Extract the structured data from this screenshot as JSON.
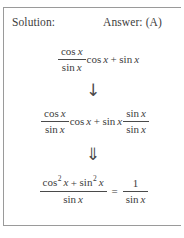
{
  "panel": {
    "header": {
      "solution_label": "Solution:",
      "answer_label": "Answer: (A)"
    },
    "steps": [
      {
        "id": "step-1",
        "description": "cos x over sin x times cos x plus sin x",
        "left_fraction_numerator_fn": "cos",
        "left_fraction_numerator_var": "x",
        "left_fraction_denominator_fn": "sin",
        "left_fraction_denominator_var": "x",
        "term_1_fn": "cos",
        "term_1_var": "x",
        "operator": "+",
        "term_2_fn": "sin",
        "term_2_var": "x"
      },
      {
        "id": "step-2",
        "description": "cos x over sin x times cos x plus sin x times sin x over sin x",
        "left_fraction_numerator_fn": "cos",
        "left_fraction_numerator_var": "x",
        "left_fraction_denominator_fn": "sin",
        "left_fraction_denominator_var": "x",
        "term_1_fn": "cos",
        "term_1_var": "x",
        "operator": "+",
        "term_2_fn": "sin",
        "term_2_var": "x",
        "right_fraction_numerator_fn": "sin",
        "right_fraction_numerator_var": "x",
        "right_fraction_denominator_fn": "sin",
        "right_fraction_denominator_var": "x"
      },
      {
        "id": "step-3",
        "description": "cos squared x plus sin squared x over sin x equals 1 over sin x",
        "numerator_fn_1": "cos",
        "numerator_exp_1": "2",
        "numerator_var_1": "x",
        "numerator_operator": "+",
        "numerator_fn_2": "sin",
        "numerator_exp_2": "2",
        "numerator_var_2": "x",
        "denominator_fn": "sin",
        "denominator_var": "x",
        "equals": "=",
        "right_numerator": "1",
        "right_denominator_fn": "sin",
        "right_denominator_var": "x"
      }
    ],
    "arrows": {
      "single_down": "↓",
      "double_down": "⇓"
    },
    "colors": {
      "text": "#3d3d3d",
      "border": "#9a9a9a",
      "rule": "#4a4a4a",
      "background": "#ffffff"
    }
  }
}
